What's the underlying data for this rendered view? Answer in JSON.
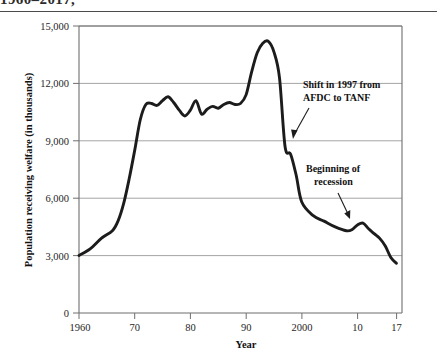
{
  "title": {
    "text": "1960–2017,",
    "clipped": true
  },
  "chart_data": {
    "type": "line",
    "xlabel": "Year",
    "ylabel": "Population receiving welfare (in thousands)",
    "xlim": [
      1960,
      2018
    ],
    "ylim": [
      0,
      15000
    ],
    "grid": true,
    "legend": null,
    "y_ticks": [
      0,
      3000,
      6000,
      9000,
      12000,
      15000
    ],
    "y_tick_labels": [
      "0",
      "3,000",
      "6,000",
      "9,000",
      "12,000",
      "15,000"
    ],
    "x_ticks": [
      1960,
      1970,
      1980,
      1990,
      2000,
      2010,
      2017
    ],
    "x_tick_labels": [
      "1960",
      "70",
      "80",
      "90",
      "2000",
      "10",
      "17"
    ],
    "series": [
      {
        "name": "Population receiving welfare",
        "color": "#1c1c1c",
        "x": [
          1960,
          1962,
          1964,
          1966,
          1967,
          1968,
          1969,
          1970,
          1971,
          1972,
          1973,
          1974,
          1975,
          1976,
          1977,
          1978,
          1979,
          1980,
          1981,
          1982,
          1983,
          1984,
          1985,
          1986,
          1987,
          1988,
          1989,
          1990,
          1991,
          1992,
          1993,
          1994,
          1995,
          1996,
          1997,
          1998,
          1999,
          2000,
          2002,
          2004,
          2006,
          2008,
          2009,
          2010,
          2011,
          2012,
          2013,
          2014,
          2015,
          2016,
          2017
        ],
        "y": [
          3005,
          3350,
          3900,
          4300,
          4800,
          5700,
          7000,
          8500,
          10100,
          10900,
          10950,
          10850,
          11100,
          11300,
          11000,
          10600,
          10300,
          10600,
          11100,
          10400,
          10650,
          10800,
          10700,
          10900,
          11000,
          10900,
          10950,
          11400,
          12600,
          13600,
          14100,
          14200,
          13650,
          12300,
          8700,
          8300,
          7200,
          5800,
          5100,
          4800,
          4500,
          4300,
          4350,
          4600,
          4700,
          4400,
          4150,
          3900,
          3500,
          2900,
          2600
        ]
      }
    ],
    "annotations": [
      {
        "id": "afdc-tanf",
        "text_lines": [
          "Shift in 1997 from",
          "AFDC to TANF"
        ],
        "points_to_year": 1997,
        "points_to_value": 8700
      },
      {
        "id": "recession",
        "text_lines": [
          "Beginning of",
          "recession"
        ],
        "points_to_year": 2008,
        "points_to_value": 4300
      }
    ]
  }
}
